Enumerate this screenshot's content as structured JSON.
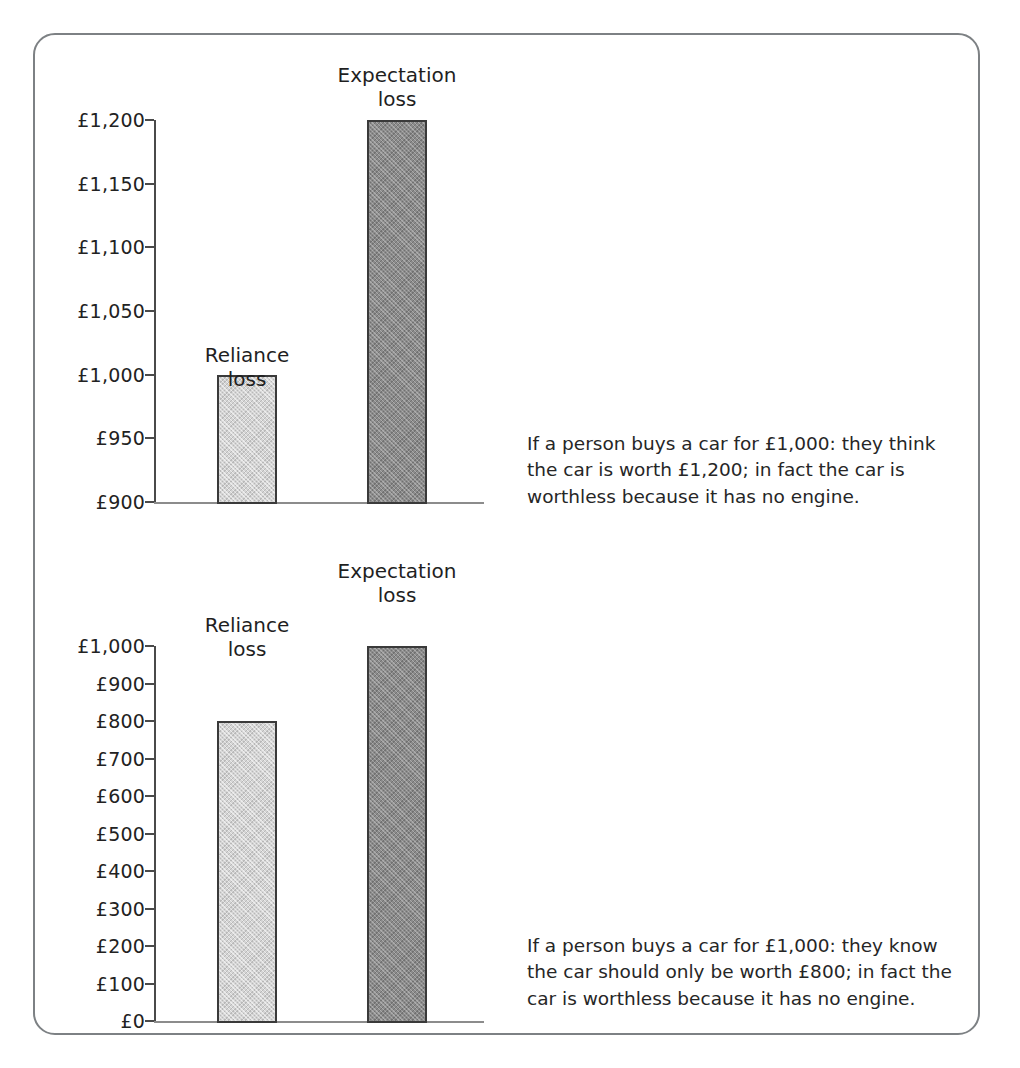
{
  "figure": {
    "border_color": "#7d8184",
    "background": "#ffffff"
  },
  "colors": {
    "reliance_bar": "#d4d4d4",
    "expectation_bar": "#8b8b8b",
    "bar_outline": "#3a3a3a",
    "axis": "#4a4a4a",
    "baseline": "#8c8c8c",
    "text": "#1f1f1f"
  },
  "chart_data": [
    {
      "type": "bar",
      "id": "top",
      "title": "",
      "xlabel": "",
      "ylabel": "",
      "categories": [
        "Reliance loss",
        "Expectation loss"
      ],
      "values": [
        1000,
        1200
      ],
      "ylim": [
        900,
        1200
      ],
      "ytick_values": [
        900,
        950,
        1000,
        1050,
        1100,
        1150,
        1200
      ],
      "ytick_labels": [
        "£900",
        "£950",
        "£1,000",
        "£1,050",
        "£1,100",
        "£1,150",
        "£1,200"
      ],
      "bar_labels": [
        "Reliance\nloss",
        "Expectation\nloss"
      ],
      "bar_styles": [
        "light",
        "dark"
      ],
      "grid": false,
      "legend": "none",
      "caption": "If a person buys a car for £1,000: they think the car is worth £1,200; in fact the car is worthless because it has no engine."
    },
    {
      "type": "bar",
      "id": "bottom",
      "title": "",
      "xlabel": "",
      "ylabel": "",
      "categories": [
        "Reliance loss",
        "Expectation loss"
      ],
      "values": [
        800,
        1000
      ],
      "ylim": [
        0,
        1000
      ],
      "ytick_values": [
        0,
        100,
        200,
        300,
        400,
        500,
        600,
        700,
        800,
        900,
        1000
      ],
      "ytick_labels": [
        "£0",
        "£100",
        "£200",
        "£300",
        "£400",
        "£500",
        "£600",
        "£700",
        "£800",
        "£900",
        "£1,000"
      ],
      "bar_labels": [
        "Reliance\nloss",
        "Expectation\nloss"
      ],
      "bar_styles": [
        "light",
        "dark"
      ],
      "grid": false,
      "legend": "none",
      "caption": "If a person buys a car for £1,000: they know the car should only be worth £800; in fact the car is worthless because it has no engine."
    }
  ]
}
